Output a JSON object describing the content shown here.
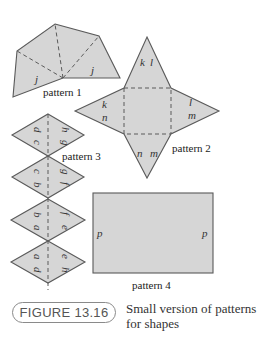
{
  "figure": {
    "label": "FIGURE 13.16",
    "caption_line1": "Small version of patterns",
    "caption_line2": "for shapes"
  },
  "patterns": {
    "p1": {
      "name": "pattern 1",
      "labels": [
        "j",
        "j"
      ]
    },
    "p2": {
      "name": "pattern 2",
      "labels": {
        "top_a": "k",
        "top_b": "l",
        "left_a": "k",
        "left_b": "n",
        "right_a": "l",
        "right_b": "m",
        "bottom_a": "n",
        "bottom_b": "m"
      }
    },
    "p3": {
      "name": "pattern 3",
      "diamonds": [
        {
          "left_a": "d",
          "left_b": "c",
          "right_a": "h",
          "right_b": "g"
        },
        {
          "left_a": "c",
          "left_b": "b",
          "right_a": "g",
          "right_b": "f"
        },
        {
          "left_a": "b",
          "left_b": "a",
          "right_a": "f",
          "right_b": "e"
        },
        {
          "left_a": "a",
          "left_b": "d",
          "right_a": "e",
          "right_b": "h"
        }
      ]
    },
    "p4": {
      "name": "pattern 4",
      "labels": [
        "p",
        "p"
      ]
    }
  },
  "colors": {
    "fill": "#d6d6d6",
    "stroke": "#5a5a5a"
  }
}
